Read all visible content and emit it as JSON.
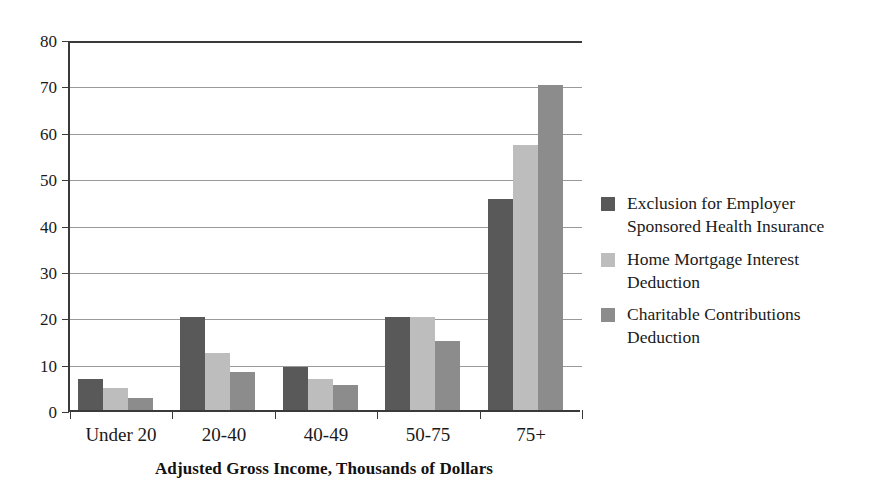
{
  "chart_data": {
    "type": "bar",
    "title": "",
    "xlabel": "Adjusted Gross Income, Thousands of Dollars",
    "ylabel": "",
    "categories": [
      "Under 20",
      "20-40",
      "40-49",
      "50-75",
      "75+"
    ],
    "ylim": [
      0,
      80
    ],
    "yticks": [
      0,
      10,
      20,
      30,
      40,
      50,
      60,
      70,
      80
    ],
    "ytick_labels": [
      "0",
      "10",
      "20",
      "30",
      "40",
      "50",
      "60",
      "70",
      "80"
    ],
    "grid": true,
    "legend_position": "right",
    "series": [
      {
        "name": "Exclusion for Employer Sponsored Health Insurance",
        "color": "#595959",
        "values": [
          6.7,
          20.0,
          9.3,
          20.1,
          45.5
        ]
      },
      {
        "name": "Home Mortgage Interest Deduction",
        "color": "#bdbdbd",
        "values": [
          4.8,
          12.4,
          6.7,
          20.0,
          57.1
        ]
      },
      {
        "name": "Charitable Contributions Deduction",
        "color": "#8c8c8c",
        "values": [
          2.5,
          8.3,
          5.4,
          14.9,
          70.0
        ]
      }
    ]
  },
  "legend": {
    "items": [
      {
        "label": "Exclusion for Employer\nSponsored Health Insurance",
        "color": "#595959"
      },
      {
        "label": "Home Mortgage Interest\nDeduction",
        "color": "#bdbdbd"
      },
      {
        "label": "Charitable Contributions\nDeduction",
        "color": "#8c8c8c"
      }
    ]
  },
  "axis": {
    "x_title": "Adjusted Gross Income, Thousands of Dollars"
  }
}
